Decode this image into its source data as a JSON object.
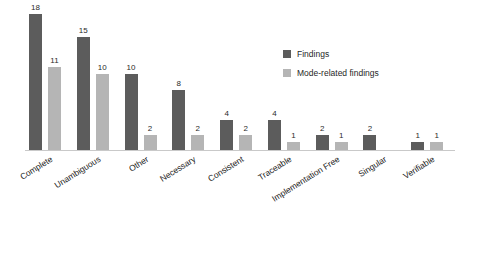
{
  "chart_data": {
    "type": "bar",
    "title": "",
    "subtitle": "",
    "xlabel": "",
    "ylabel": "",
    "ylim": [
      0,
      18
    ],
    "grid": false,
    "legend_position": "upper-right",
    "categories": [
      "Complete",
      "Unambiguous",
      "Other",
      "Necessary",
      "Consistent",
      "Traceable",
      "Implementation Free",
      "Singular",
      "Verifiable"
    ],
    "series": [
      {
        "name": "Findings",
        "color": "#5c5c5c",
        "values": [
          18,
          15,
          10,
          8,
          4,
          4,
          2,
          2,
          1
        ]
      },
      {
        "name": "Mode-related findings",
        "color": "#b5b5b5",
        "values": [
          11,
          10,
          2,
          2,
          2,
          1,
          1,
          null,
          1
        ]
      }
    ],
    "value_labels": [
      [
        "18",
        "11"
      ],
      [
        "15",
        "10"
      ],
      [
        "10",
        "2"
      ],
      [
        "8",
        "2"
      ],
      [
        "4",
        "2"
      ],
      [
        "4",
        "1"
      ],
      [
        "2",
        "1"
      ],
      [
        "2",
        null
      ],
      [
        "1",
        "1"
      ]
    ]
  },
  "legend": {
    "entries": [
      {
        "label": "Findings",
        "swatch": "legend-swatch-findings"
      },
      {
        "label": "Mode-related findings",
        "swatch": "legend-swatch-mode-related-findings"
      }
    ]
  },
  "colors": {
    "series_findings": "#5c5c5c",
    "series_mode_related": "#b5b5b5",
    "axis": "#c9c9c9",
    "text": "#2b2b2b",
    "background": "#ffffff"
  }
}
